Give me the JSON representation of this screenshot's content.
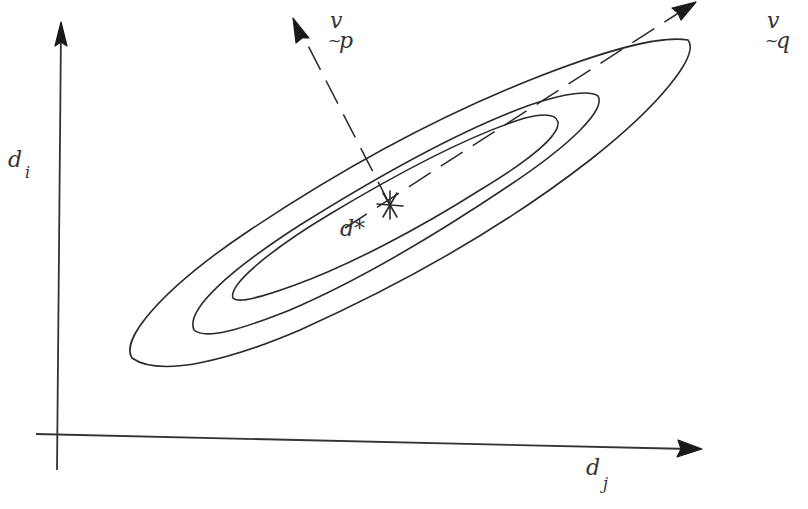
{
  "diagram": {
    "axes": {
      "x_label": {
        "base": "d",
        "sub": "j"
      },
      "y_label": {
        "base": "d",
        "sub": "i"
      }
    },
    "center_label": "d*",
    "vectors": {
      "minor": {
        "base": "v",
        "under": "~",
        "sub": "p"
      },
      "major": {
        "base": "v",
        "under": "~",
        "sub": "q"
      }
    },
    "contours": [
      "outer",
      "middle",
      "inner"
    ],
    "colors": {
      "ink": "#2a2a2a",
      "background": "#ffffff"
    }
  }
}
